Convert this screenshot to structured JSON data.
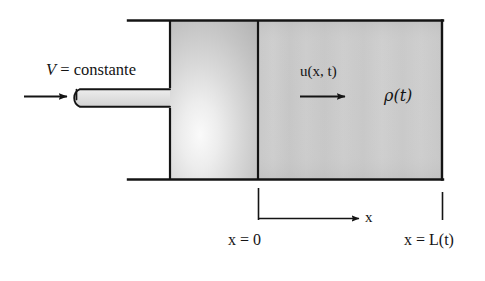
{
  "figure": {
    "type": "engineering-schematic",
    "background_color": "#ffffff",
    "ink_color": "#141414"
  },
  "labels": {
    "velocity_inlet": "V = constante",
    "velocity_inlet_symbol": "V",
    "velocity_inlet_value": "constante",
    "velocity_field": "u(x, t)",
    "density": "ρ(t)",
    "axis_x": "x",
    "x_origin": "x = 0",
    "x_length": "x = L(t)"
  },
  "geometry": {
    "container": {
      "top_wall_y": 20,
      "bottom_wall_y": 180,
      "wall_left_x": 128,
      "wall_right_x": 443
    },
    "piston_region": {
      "x_start": 170,
      "x_end": 258,
      "fill": "#c8c8c8"
    },
    "gas_region": {
      "x_start": 258,
      "x_end": 443,
      "fill": "#c9c9c9"
    },
    "divider_x": 258,
    "inlet_pipe": {
      "x_start": 72,
      "x_end": 170,
      "y_top": 88,
      "y_bottom": 108
    },
    "inlet_arrow": {
      "x_start": 24,
      "x_end": 68,
      "y": 96
    },
    "flow_arrow": {
      "x_start": 300,
      "x_end": 346,
      "y": 96
    },
    "axis_arrow": {
      "x_start": 259,
      "x_end": 360,
      "y": 218
    },
    "tick_origin": {
      "x": 258,
      "y_top": 188,
      "y_bottom": 220
    },
    "tick_length": {
      "x": 443,
      "y_top": 192,
      "y_bottom": 220
    }
  },
  "colors": {
    "ink": "#141414",
    "shade_light": "#f2f2f2",
    "shade_mid": "#c9c9c9",
    "shade_dark": "#b2b2b2",
    "background": "#ffffff"
  }
}
